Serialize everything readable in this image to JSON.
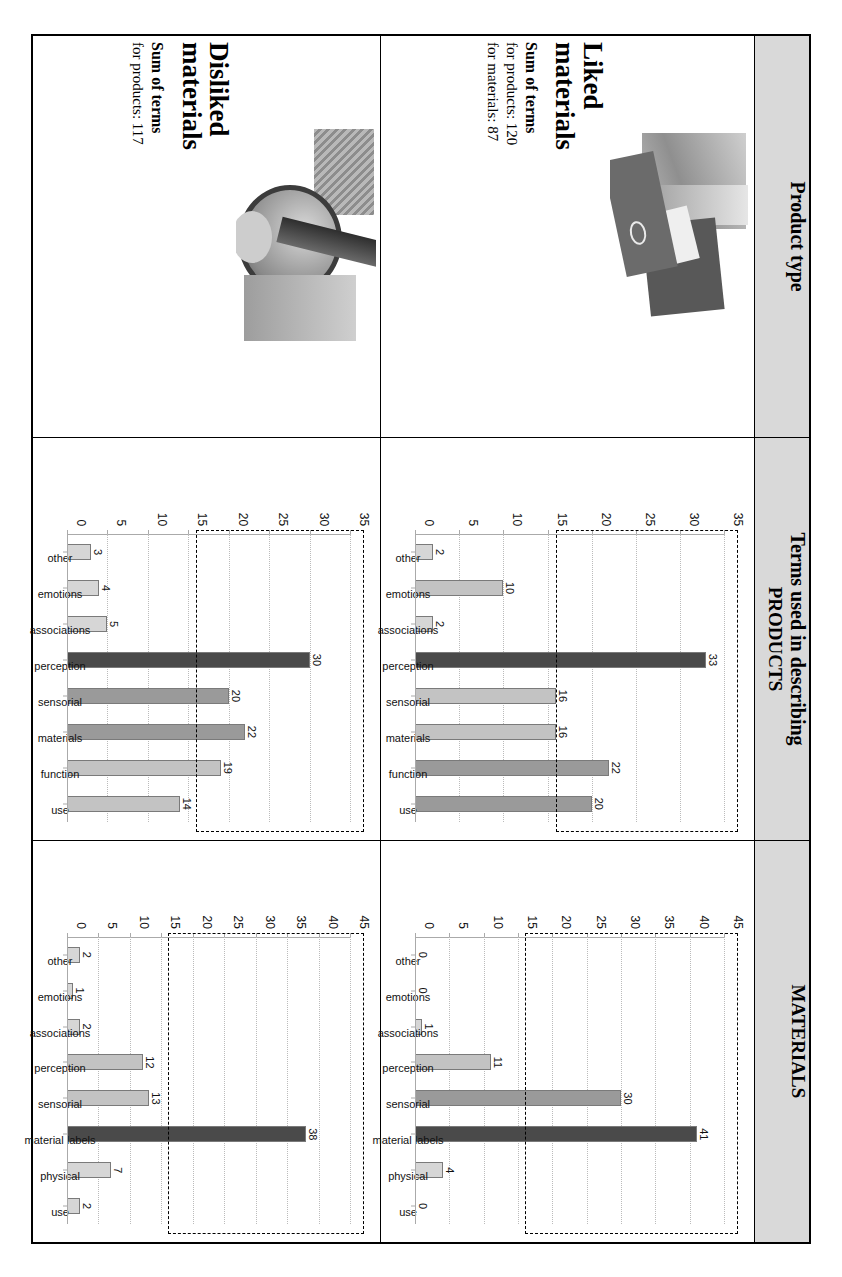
{
  "figure": {
    "columns": [
      {
        "id": "product-type",
        "label": "Product type"
      },
      {
        "id": "products",
        "label": "Terms used in describing",
        "sublabel": "PRODUCTS"
      },
      {
        "id": "materials",
        "label": "",
        "sublabel": "MATERIALS"
      }
    ]
  },
  "rows": [
    {
      "id": "liked",
      "title_line1": "Liked",
      "title_line2": "materials",
      "sum_title": "Sum of terms",
      "sum_products": "for products: 120",
      "sum_materials": "for materials: 87",
      "photo_name": "liked-materials-photo"
    },
    {
      "id": "disliked",
      "title_line1": "Disliked",
      "title_line2": "materials",
      "sum_title": "Sum of terms",
      "sum_products": "for products: 117",
      "sum_materials": "",
      "photo_name": "disliked-materials-photo"
    }
  ],
  "chart_data": [
    {
      "id": "liked-products",
      "type": "bar",
      "title": "",
      "categories": [
        "other",
        "emotions",
        "associations",
        "perception",
        "sensorial",
        "materials",
        "function",
        "use"
      ],
      "values": [
        2,
        10,
        2,
        33,
        16,
        16,
        22,
        20
      ],
      "highlight_index": 3,
      "xlabel": "",
      "ylabel": "",
      "ylim": [
        0,
        35
      ],
      "yticks": [
        0,
        5,
        10,
        15,
        20,
        25,
        30,
        35
      ],
      "grid": true,
      "annotation_threshold": 16
    },
    {
      "id": "liked-materials",
      "type": "bar",
      "title": "",
      "categories": [
        "other",
        "emotions",
        "associations",
        "perception",
        "sensorial",
        "material labels",
        "physical",
        "use"
      ],
      "values": [
        0,
        0,
        1,
        11,
        30,
        41,
        4,
        0
      ],
      "highlight_index": 5,
      "xlabel": "",
      "ylabel": "",
      "ylim": [
        0,
        45
      ],
      "yticks": [
        0,
        5,
        10,
        15,
        20,
        25,
        30,
        35,
        40,
        45
      ],
      "grid": true,
      "annotation_threshold": 16
    },
    {
      "id": "disliked-products",
      "type": "bar",
      "title": "",
      "categories": [
        "other",
        "emotions",
        "associations",
        "perception",
        "sensorial",
        "materials",
        "function",
        "use"
      ],
      "values": [
        3,
        4,
        5,
        30,
        20,
        22,
        19,
        14
      ],
      "highlight_index": 3,
      "xlabel": "",
      "ylabel": "",
      "ylim": [
        0,
        35
      ],
      "yticks": [
        0,
        5,
        10,
        15,
        20,
        25,
        30,
        35
      ],
      "grid": true,
      "annotation_threshold": 16
    },
    {
      "id": "disliked-materials",
      "type": "bar",
      "title": "",
      "categories": [
        "other",
        "emotions",
        "associations",
        "perception",
        "sensorial",
        "material labels",
        "physical",
        "use"
      ],
      "values": [
        2,
        1,
        2,
        12,
        13,
        38,
        7,
        2
      ],
      "highlight_index": 5,
      "xlabel": "",
      "ylabel": "",
      "ylim": [
        0,
        45
      ],
      "yticks": [
        0,
        5,
        10,
        15,
        20,
        25,
        30,
        35,
        40,
        45
      ],
      "grid": true,
      "annotation_threshold": 16
    }
  ],
  "colors": {
    "header_bg": "#d9d9d9",
    "bar_light": "#d6d6d6",
    "bar_mid": "#9a9a9a",
    "bar_dark": "#4a4a4a",
    "bar_edge": "#7a7a7a",
    "rule": "#000000"
  }
}
